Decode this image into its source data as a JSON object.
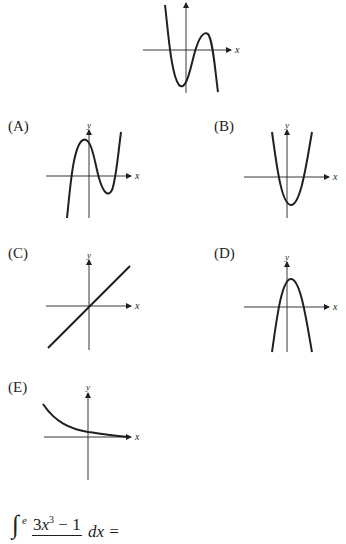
{
  "question": {
    "stem_graph": {
      "description": "Graph of a cubic with negative leading coefficient: starts high on the left, local minimum below x-axis just left of y-axis, local maximum above x-axis right of y-axis, ends low on the right",
      "axis_labels": {
        "x": "x",
        "y": "y"
      }
    },
    "choices": [
      {
        "label": "(A)",
        "description": "Cubic with positive leading coefficient: local max left of y-axis above x-axis, local min right of y-axis below x-axis",
        "axis_labels": {
          "x": "x",
          "y": "y"
        }
      },
      {
        "label": "(B)",
        "description": "Upward-opening parabola with vertex below x-axis slightly right of y-axis",
        "axis_labels": {
          "x": "x",
          "y": "y"
        }
      },
      {
        "label": "(C)",
        "description": "Straight line through the origin with positive slope",
        "axis_labels": {
          "x": "x",
          "y": "y"
        }
      },
      {
        "label": "(D)",
        "description": "Downward-opening parabola with vertex above x-axis slightly right of y-axis",
        "axis_labels": {
          "x": "x",
          "y": "y"
        }
      },
      {
        "label": "(E)",
        "description": "Decaying exponential curve approaching the x-axis from above",
        "axis_labels": {
          "x": "x",
          "y": "y"
        }
      }
    ]
  },
  "next_question": {
    "integral_sign": "∫",
    "upper_limit": "e",
    "numerator_coef": "3",
    "numerator_var": "x",
    "numerator_exp": "3",
    "numerator_rest": " − 1",
    "differential": "dx =",
    "partially_visible": true
  }
}
